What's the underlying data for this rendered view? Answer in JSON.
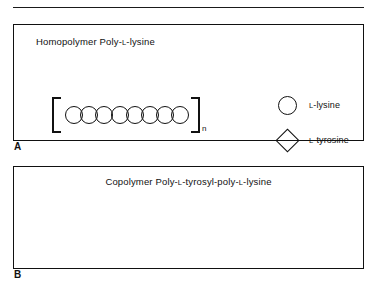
{
  "figure": {
    "top_rule": true,
    "panels": [
      {
        "label": "A",
        "title_prefix": "Homopolymer Poly-",
        "title_l1": "L",
        "title_mid": "-lysine",
        "title_full": "Homopolymer Poly-L-lysine",
        "chain": {
          "bracket_open": "[",
          "bracket_close": "]",
          "subscript": "n",
          "units": [
            "circle",
            "circle",
            "circle",
            "circle",
            "circle",
            "circle",
            "circle",
            "circle"
          ],
          "unit_count": 8
        }
      },
      {
        "label": "B",
        "title_prefix": "Copolymer Poly-",
        "title_l1": "L",
        "title_mid": "-tyrosyl-poly-",
        "title_l2": "L",
        "title_suffix": "-lysine",
        "title_full": "Copolymer Poly-L-tyrosyl-poly-L-lysine",
        "chain": {
          "bracket_open": "[",
          "bracket_close": "]",
          "subscript": "n",
          "units": [
            "diamond",
            "circle",
            "diamond",
            "circle",
            "diamond",
            "circle",
            "diamond"
          ],
          "unit_count": 7
        }
      }
    ],
    "legend": {
      "items": [
        {
          "glyph": "circle",
          "label_sc": "L",
          "label_rest": "-lysine",
          "label_full": "L-lysine"
        },
        {
          "glyph": "diamond",
          "label_sc": "L",
          "label_rest": "-tyrosine",
          "label_full": "L-tyrosine"
        }
      ]
    },
    "colors": {
      "ink": "#111111",
      "background": "#ffffff"
    }
  }
}
